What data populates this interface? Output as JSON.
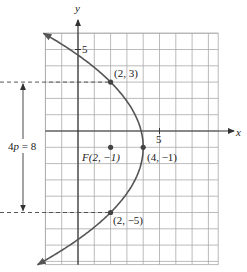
{
  "figure": {
    "type": "parabola-graph",
    "equation_form": "(y + 1)^2 = -8(x - 4)",
    "axis_labels": {
      "x": "x",
      "y": "y"
    },
    "tick_labels": {
      "x": "5",
      "y": "5"
    },
    "ticks": {
      "x": 5,
      "y": 5
    },
    "grid": {
      "x_range": [
        -2,
        8.6
      ],
      "y_range": [
        -8.2,
        6
      ],
      "step": 1
    },
    "vertex": {
      "x": 4,
      "y": -1,
      "label": "(4, −1)"
    },
    "focus": {
      "x": 2,
      "y": -1,
      "label": "F(2, −1)"
    },
    "points": [
      {
        "x": 2,
        "y": 3,
        "label": "(2, 3)"
      },
      {
        "x": 2,
        "y": -5,
        "label": "(2, −5)"
      }
    ],
    "parabola": {
      "h": 4,
      "k": -1,
      "p": -2,
      "y_from": -8.2,
      "y_to": 6
    },
    "latus_rectum_label": {
      "prefix": "4",
      "var": "p",
      "suffix": " = 8"
    },
    "colors": {
      "curve": "#555555",
      "grid": "#aaaaaa",
      "axis": "#333333",
      "text": "#222222"
    }
  }
}
